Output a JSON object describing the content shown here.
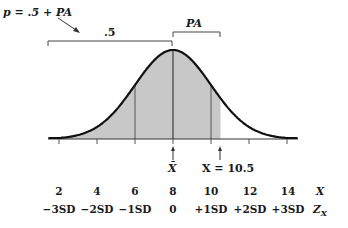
{
  "annotations": {
    "formula": "p = .5 + PA",
    "half_label": ".5",
    "pa_label": "PA",
    "mean_label": "X̄",
    "x_value_label": "X = 10.5"
  },
  "axis_rows": {
    "x_label": "X",
    "z_label": "Z",
    "z_subscript": "X",
    "x_values": [
      "2",
      "4",
      "6",
      "8",
      "10",
      "12",
      "14"
    ],
    "z_values": [
      "−3SD",
      "−2SD",
      "−1SD",
      "0",
      "+1SD",
      "+2SD",
      "+3SD"
    ]
  },
  "chart_data": {
    "type": "area",
    "distribution": "normal",
    "mean": 8,
    "sd": 2,
    "x_ticks": [
      2,
      4,
      6,
      8,
      10,
      12,
      14
    ],
    "z_ticks": [
      "-3SD",
      "-2SD",
      "-1SD",
      "0",
      "+1SD",
      "+2SD",
      "+3SD"
    ],
    "shaded_region": {
      "from": "-inf",
      "to": 10.5
    },
    "vertical_lines_at": [
      6,
      8,
      10
    ],
    "marked_points": [
      {
        "label": "X̄",
        "x": 8
      },
      {
        "label": "X = 10.5",
        "x": 10.5
      }
    ],
    "brackets": [
      {
        "label": ".5",
        "from": "-inf",
        "to": 8
      },
      {
        "label": "PA",
        "from": 8,
        "to": 10.5
      }
    ],
    "grid": false
  },
  "colors": {
    "shade": "#c8c8c8",
    "curve": "#111111",
    "line": "#444444"
  }
}
